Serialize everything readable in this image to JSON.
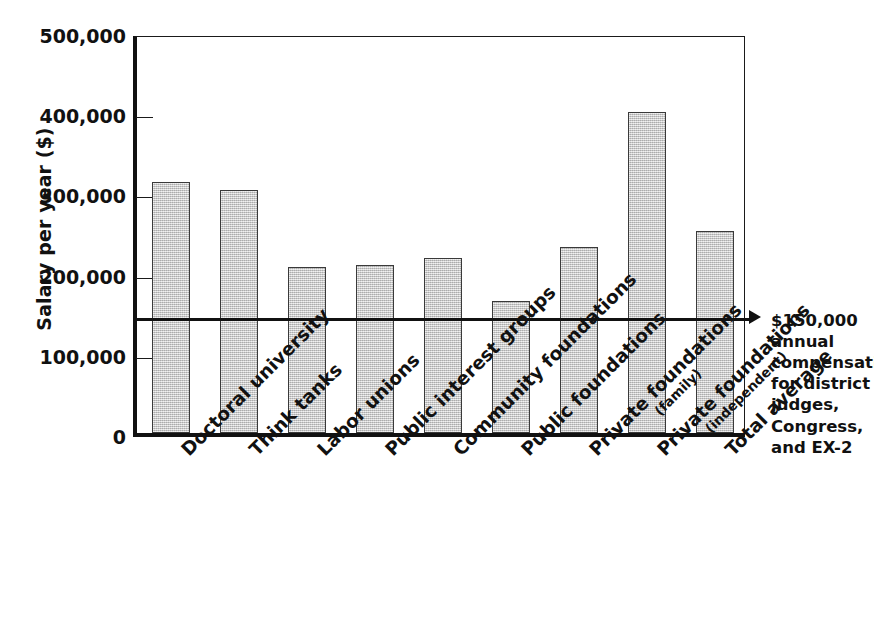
{
  "chart_data": {
    "type": "bar",
    "title": "",
    "xlabel": "",
    "ylabel": "Salary per year ($)",
    "ylim": [
      0,
      500000
    ],
    "ytick_values": [
      0,
      100000,
      200000,
      300000,
      400000,
      500000
    ],
    "ytick_labels": [
      "0",
      "100,000",
      "200,000",
      "300,000",
      "400,000",
      "500,000"
    ],
    "grid": false,
    "legend": "none",
    "bar_color": "#c8c8c8",
    "bar_edge_color": "#3a3a3a",
    "axis_color": "#111111",
    "categories": [
      "Doctoral university",
      "Think tanks",
      "Labor unions",
      "Public interest groups",
      "Community foundations",
      "Public foundations",
      "Private foundations",
      "Private foundations",
      "Total average"
    ],
    "category_sublabels": [
      "",
      "",
      "",
      "",
      "",
      "",
      "(family)",
      "(independent)",
      ""
    ],
    "values": [
      313000,
      303000,
      207000,
      210000,
      218000,
      165000,
      232000,
      400000,
      252000
    ],
    "annotations": [
      {
        "name": "reference-line",
        "value": 150000,
        "label": "$150,000 annual compensation for district judges, Congress, and EX-2",
        "label_lines": [
          "$150,000",
          "annual",
          "compensation",
          "for district",
          "judges,",
          "Congress,",
          "and EX-2"
        ],
        "marker": "arrow-right"
      }
    ]
  }
}
